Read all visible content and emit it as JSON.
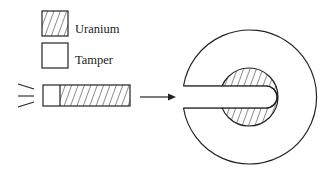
{
  "diagram": {
    "type": "gun-type fission device schematic",
    "legend": {
      "items": [
        {
          "key": "uranium",
          "label": "Uranium",
          "swatch": "hatched"
        },
        {
          "key": "tamper",
          "label": "Tamper",
          "swatch": "blank"
        }
      ]
    },
    "projectile": {
      "label": "",
      "segments": [
        "tamper",
        "uranium"
      ]
    },
    "arrow": {
      "direction": "right"
    },
    "target": {
      "outer": "tamper ring with channel",
      "inner": "uranium (hatched)"
    },
    "colors": {
      "stroke": "#222222",
      "background": "#ffffff"
    }
  }
}
